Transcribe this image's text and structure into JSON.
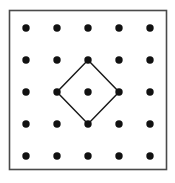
{
  "figure": {
    "title": "Square dot lattice with inscribed tilted square",
    "canvas": {
      "width": 175,
      "height": 183,
      "background_color": "#ffffff"
    },
    "frame": {
      "name": "outer-square-border",
      "x": 9.5,
      "y": 10.5,
      "width": 157,
      "height": 159,
      "stroke_color": "#4a4a4a",
      "stroke_width": 1.6,
      "fill": "none"
    },
    "lattice": {
      "rows": 5,
      "cols": 5,
      "x_positions": [
        26,
        57,
        88,
        119,
        150
      ],
      "y_positions": [
        28,
        60,
        92,
        124,
        156
      ],
      "spacing_x": 31,
      "spacing_y": 32,
      "dot_radius": 3.7,
      "dot_color": "#111111",
      "dot_count": 25
    },
    "polygon": {
      "name": "inscribed-tilted-square",
      "type": "diamond",
      "vertex_count": 4,
      "vertices": [
        {
          "label": "top",
          "col": 2,
          "row": 1,
          "x": 88,
          "y": 60
        },
        {
          "label": "right",
          "col": 3,
          "row": 2,
          "x": 119,
          "y": 92
        },
        {
          "label": "bottom",
          "col": 2,
          "row": 3,
          "x": 88,
          "y": 124
        },
        {
          "label": "left",
          "col": 1,
          "row": 2,
          "x": 57,
          "y": 92
        }
      ],
      "stroke_color": "#1a1a1a",
      "stroke_width": 1.5,
      "fill": "none",
      "interior_lattice_points": 1,
      "boundary_lattice_points": 4,
      "center": {
        "col": 2,
        "row": 2,
        "x": 88,
        "y": 92
      }
    }
  }
}
